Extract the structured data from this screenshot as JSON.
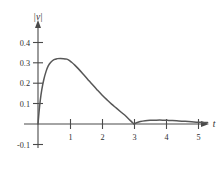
{
  "chart_data": {
    "type": "line",
    "title": "",
    "subtitle": "",
    "xlabel": "t",
    "ylabel": "|v|",
    "xlim": [
      -0.12,
      5.45
    ],
    "ylim": [
      -0.13,
      0.47
    ],
    "grid": false,
    "legend": null,
    "x_ticks": [
      "1",
      "2",
      "3",
      "4",
      "5"
    ],
    "x_tick_values": [
      1,
      2,
      3,
      4,
      5
    ],
    "y_ticks": [
      "0.4",
      "0.3",
      "0.2",
      "0.1",
      "-0.1"
    ],
    "y_tick_values": [
      0.4,
      0.3,
      0.2,
      0.1,
      -0.1
    ],
    "series": [
      {
        "name": "|v|",
        "color": "#575757",
        "x": [
          0.0,
          0.03,
          0.07,
          0.12,
          0.18,
          0.25,
          0.32,
          0.4,
          0.5,
          0.6,
          0.7,
          0.8,
          0.88,
          0.95,
          1.05,
          1.15,
          1.25,
          1.4,
          1.55,
          1.7,
          1.85,
          2.0,
          2.15,
          2.3,
          2.45,
          2.6,
          2.75,
          2.88,
          2.96,
          3.0,
          3.08,
          3.2,
          3.35,
          3.5,
          3.7,
          3.9,
          4.05,
          4.2,
          4.4,
          4.6,
          4.8,
          5.0,
          5.2,
          5.3
        ],
        "y": [
          0.0,
          0.055,
          0.115,
          0.17,
          0.218,
          0.258,
          0.286,
          0.304,
          0.317,
          0.322,
          0.323,
          0.322,
          0.32,
          0.316,
          0.304,
          0.29,
          0.274,
          0.248,
          0.221,
          0.194,
          0.168,
          0.143,
          0.12,
          0.098,
          0.078,
          0.058,
          0.038,
          0.018,
          0.006,
          0.0,
          0.006,
          0.012,
          0.016,
          0.018,
          0.019,
          0.019,
          0.018,
          0.017,
          0.015,
          0.013,
          0.011,
          0.009,
          0.008,
          0.007
        ]
      }
    ],
    "annotations": [
      {
        "name": "x-axis-arrow",
        "at": [
          5.35,
          0
        ]
      },
      {
        "name": "y-axis-arrow",
        "at": [
          0,
          0.455
        ]
      }
    ],
    "colors": {
      "curve": "#575757",
      "axis": "#4a4a4a",
      "text": "#2e2e2e",
      "background": "#ffffff"
    }
  }
}
